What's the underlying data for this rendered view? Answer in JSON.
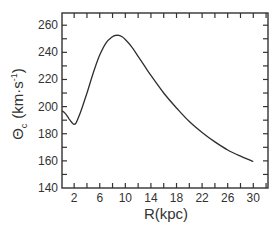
{
  "chart_data": {
    "type": "line",
    "title": "",
    "xlabel": "R(kpc)",
    "ylabel": "Θc (km·s⁻¹)",
    "ylabel_parts": {
      "symbol": "Θ",
      "subscript": "c",
      "units_open": "(km",
      "units_dot": "·",
      "units_s": "s",
      "units_sup": "-1",
      "units_close": ")"
    },
    "xlim": [
      0.1,
      32.3
    ],
    "ylim": [
      140,
      269
    ],
    "xticks": [
      2,
      6,
      10,
      14,
      18,
      22,
      26,
      30
    ],
    "xtick_labels": [
      "2",
      "6",
      "10",
      "14",
      "18",
      "22",
      "26",
      "30"
    ],
    "yticks": [
      140,
      160,
      180,
      200,
      220,
      240,
      260
    ],
    "ytick_labels": [
      "140",
      "160",
      "180",
      "200",
      "220",
      "240",
      "260"
    ],
    "grid": false,
    "legend": null,
    "series": [
      {
        "name": "Rotation curve",
        "x": [
          0.1,
          0.6,
          1.2,
          1.8,
          2.0,
          2.3,
          3.0,
          4.0,
          5.0,
          6.0,
          7.0,
          8.0,
          8.5,
          9.0,
          9.5,
          10.0,
          11.0,
          12.0,
          13.0,
          14.0,
          16.0,
          18.0,
          20.0,
          22.0,
          24.0,
          26.0,
          28.0,
          30.0
        ],
        "y": [
          197,
          195,
          191,
          187.5,
          187,
          188,
          196,
          210,
          225,
          238,
          247,
          251.5,
          252.5,
          252.5,
          251.5,
          249.5,
          244,
          237,
          230,
          223,
          210,
          199,
          189,
          181,
          174,
          168,
          163.5,
          159.5
        ]
      }
    ]
  }
}
